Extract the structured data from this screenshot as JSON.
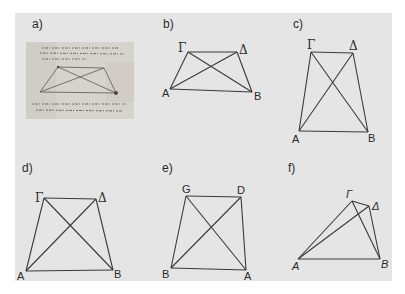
{
  "figure": {
    "panels": [
      {
        "id": "a",
        "label": "a)",
        "content": "manuscript-photo",
        "description": "Photograph of a manuscript page with handwritten text and a quadrilateral drawing with diagonals"
      },
      {
        "id": "b",
        "label": "b)",
        "vertices": {
          "top_left": "Γ",
          "top_right": "Δ",
          "bottom_left": "A",
          "bottom_right": "B"
        }
      },
      {
        "id": "c",
        "label": "c)",
        "vertices": {
          "top_left": "Γ",
          "top_right": "Δ",
          "bottom_left": "A",
          "bottom_right": "B"
        }
      },
      {
        "id": "d",
        "label": "d)",
        "vertices": {
          "top_left": "Γ",
          "top_right": "Δ",
          "bottom_left": "A",
          "bottom_right": "B"
        }
      },
      {
        "id": "e",
        "label": "e)",
        "vertices": {
          "top_left": "G",
          "top_right": "D",
          "bottom_left": "B",
          "bottom_right": "A"
        }
      },
      {
        "id": "f",
        "label": "f)",
        "vertices": {
          "top_left": "Γ",
          "top_right": "Δ",
          "bottom_left": "A",
          "bottom_right": "B"
        }
      }
    ]
  },
  "colors": {
    "panel_background": "#e5e5e5",
    "line": "#3a3a3a",
    "text": "#2a2a2a"
  }
}
